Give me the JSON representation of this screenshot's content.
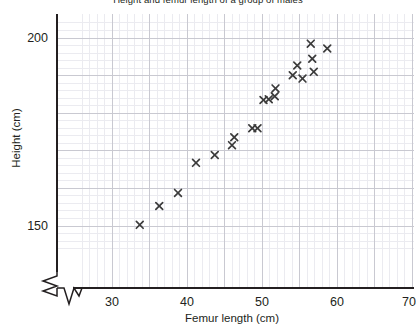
{
  "chart_data": {
    "type": "scatter",
    "title": "Height and femur length of a group of males",
    "xlabel": "Femur length (cm)",
    "ylabel": "Height (cm)",
    "xlim": [
      26,
      71
    ],
    "ylim": [
      143,
      204
    ],
    "xticks": [
      30,
      40,
      50,
      60,
      70
    ],
    "yticks": [
      150,
      200
    ],
    "grid": true,
    "grid_major_step_x": 5,
    "grid_major_step_y": 10,
    "grid_minor_step_x": 1,
    "grid_minor_step_y": 2,
    "axis_break_x": true,
    "axis_break_y": true,
    "marker": "x",
    "marker_color": "#3b3b3b",
    "legend": null,
    "n_points": 20,
    "x": [
      33.7,
      36.3,
      38.8,
      41.2,
      43.7,
      46.0,
      46.3,
      48.7,
      49.4,
      50.2,
      50.9,
      51.7,
      51.8,
      54.1,
      54.7,
      55.4,
      56.5,
      56.7,
      56.9,
      58.7
    ],
    "y": [
      150.3,
      155.3,
      158.8,
      166.8,
      168.9,
      171.5,
      173.6,
      176.0,
      176.0,
      183.5,
      183.7,
      184.5,
      186.6,
      190.1,
      192.7,
      189.2,
      198.5,
      194.5,
      191.0,
      197.2
    ],
    "points": [
      {
        "x": 33.7,
        "y": 150.3
      },
      {
        "x": 36.3,
        "y": 155.3
      },
      {
        "x": 38.8,
        "y": 158.8
      },
      {
        "x": 41.2,
        "y": 166.8
      },
      {
        "x": 43.7,
        "y": 168.9
      },
      {
        "x": 46.0,
        "y": 171.5
      },
      {
        "x": 46.3,
        "y": 173.6
      },
      {
        "x": 48.7,
        "y": 176.0
      },
      {
        "x": 49.4,
        "y": 176.0
      },
      {
        "x": 50.2,
        "y": 183.5
      },
      {
        "x": 50.9,
        "y": 183.7
      },
      {
        "x": 51.7,
        "y": 184.5
      },
      {
        "x": 51.8,
        "y": 186.6
      },
      {
        "x": 54.1,
        "y": 190.1
      },
      {
        "x": 54.7,
        "y": 192.7
      },
      {
        "x": 55.4,
        "y": 189.2
      },
      {
        "x": 56.5,
        "y": 198.5
      },
      {
        "x": 56.7,
        "y": 194.5
      },
      {
        "x": 56.9,
        "y": 191.0
      },
      {
        "x": 58.7,
        "y": 197.2
      }
    ]
  },
  "axes": {
    "x_tick_labels": [
      "30",
      "40",
      "50",
      "60",
      "70"
    ],
    "y_tick_labels": [
      "200",
      "150"
    ],
    "x_title": "Femur length (cm)",
    "y_title": "Height (cm)"
  },
  "colors": {
    "marker": "#3b3b3b",
    "axis": "#231f20",
    "grid_major": "#c9c9d1",
    "grid_minor": "#ebebf0",
    "text": "#231f20",
    "background": "#ffffff"
  }
}
